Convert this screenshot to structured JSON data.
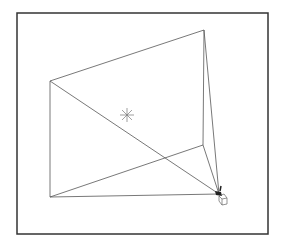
{
  "canvas": {
    "width": 281,
    "height": 247,
    "background": "#ffffff"
  },
  "frame": {
    "x": 17,
    "y": 13,
    "width": 251,
    "height": 221,
    "stroke": "#333333",
    "stroke_width": 1.5
  },
  "colors": {
    "line": "#555555",
    "marker": "#777777",
    "camera": "#222222"
  },
  "frustum": {
    "apex": [
      219,
      194
    ],
    "vertices": {
      "top_left": [
        50,
        81
      ],
      "top_right": [
        204,
        30
      ],
      "inner_right": [
        203,
        145
      ],
      "bottom_left": [
        50,
        197
      ]
    }
  },
  "target_marker": {
    "type": "asterisk",
    "center": [
      127,
      115
    ],
    "size": 7
  },
  "camera_icon": {
    "position": [
      219,
      194
    ]
  }
}
